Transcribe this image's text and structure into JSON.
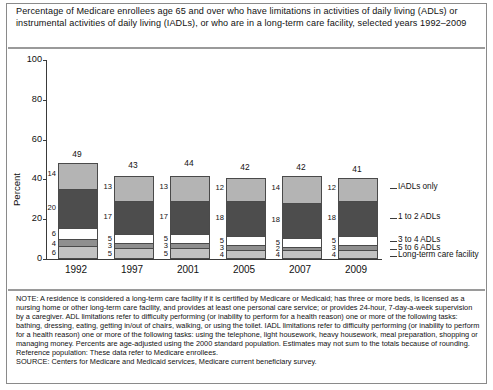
{
  "title": "Percentage of Medicare enrollees age 65 and over who have limitations in activities of daily living (ADLs) or instrumental activities of daily living (IADLs), or who are in a long-term care facility, selected years 1992–2009",
  "chart_data": {
    "type": "bar",
    "stacked": true,
    "title": "Percentage of Medicare enrollees age 65 and over who have limitations in activities of daily living (ADLs) or instrumental activities of daily living (IADLs), or who are in a long-term care facility, selected years 1992–2009",
    "xlabel": "",
    "ylabel": "Percent",
    "ylim": [
      0,
      100
    ],
    "yticks": [
      "0",
      "20",
      "40",
      "60",
      "80",
      "100"
    ],
    "grid": false,
    "legend_position": "right",
    "categories": [
      "1992",
      "1997",
      "2001",
      "2005",
      "2007",
      "2009"
    ],
    "totals": [
      49,
      43,
      44,
      42,
      42,
      41
    ],
    "series": [
      {
        "name": "IADLs only",
        "values": [
          14,
          13,
          13,
          12,
          14,
          12
        ],
        "color": "#b4b4b4"
      },
      {
        "name": "1 to 2 ADLs",
        "values": [
          20,
          17,
          17,
          18,
          18,
          18
        ],
        "color": "#4d4d4d"
      },
      {
        "name": "3 to 4 ADLs",
        "values": [
          6,
          5,
          5,
          5,
          5,
          5
        ],
        "color": "#ffffff"
      },
      {
        "name": "5 to 6 ADLs",
        "values": [
          4,
          3,
          3,
          3,
          2,
          3
        ],
        "color": "#8f8f8f"
      },
      {
        "name": "Long-term care facility",
        "values": [
          6,
          5,
          5,
          4,
          4,
          4
        ],
        "color": "#c2c2c2"
      }
    ]
  },
  "legend": [
    {
      "label": "IADLs only"
    },
    {
      "label": "1 to 2 ADLs"
    },
    {
      "label": "3 to 4 ADLs"
    },
    {
      "label": "5 to 6 ADLs"
    },
    {
      "label": "Long-term care facility"
    }
  ],
  "note": {
    "body": "NOTE:  A residence is considered a long-term care facility if it is certified by Medicare or Medicaid; has three or more beds, is licensed as a nursing home or other long-term care facility, and provides at least one personal care service; or provides 24-hour, 7-day-a-week supervision by a caregiver.  ADL limitations refer to difficulty performing (or inability to perform for a health reason) one or more of the following tasks:  bathing, dressing, eating, getting in/out of chairs, walking, or using the toilet.  IADL limitations refer to difficulty performing (or inability to perform for a health reason) one or more of the following tasks:  using the telephone, light housework, heavy housework, meal preparation, shopping or managing money.  Percents are age-adjusted using the 2000 standard population.  Estimates may not sum to the totals because of rounding.  Reference population:  These data refer to Medicare enrollees.",
    "source": "SOURCE:  Centers for Medicare and Medicaid services, Medicare current beneficiary survey."
  }
}
